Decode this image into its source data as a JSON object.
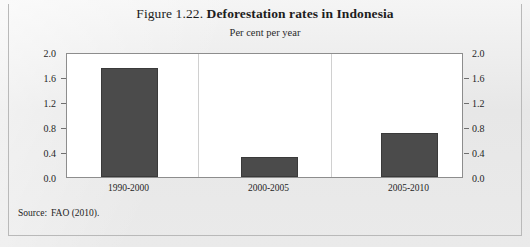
{
  "figure": {
    "label": "Figure 1.22.",
    "name": "Deforestation rates in Indonesia",
    "subtitle": "Per cent per year",
    "source_label": "Source:",
    "source_text": "FAO (2010)."
  },
  "colors": {
    "bar_fill": "#4b4b4b",
    "bar_stroke": "#3a3a3a",
    "plot_background": "#ffffff",
    "page_background": "#e8e8e8",
    "frame_border": "#b9b9b9",
    "axis_line": "#8d8d8d",
    "text": "#1f1f1f"
  },
  "chart_data": {
    "type": "bar",
    "title": "Figure 1.22. Deforestation rates in Indonesia",
    "subtitle": "Per cent per year",
    "xlabel": "",
    "ylabel": "Per cent per year",
    "categories": [
      "1990-2000",
      "2000-2005",
      "2005-2010"
    ],
    "values": [
      1.75,
      0.32,
      0.7
    ],
    "ylim": [
      0.0,
      2.0
    ],
    "yticks": [
      0.0,
      0.4,
      0.8,
      1.2,
      1.6,
      2.0
    ],
    "ytick_labels": [
      "0.0",
      "0.4",
      "0.8",
      "1.2",
      "1.6",
      "2.0"
    ],
    "dual_axis": true,
    "right_ytick_labels": [
      "0.0",
      "0.4",
      "0.8",
      "1.2",
      "1.6",
      "2.0"
    ],
    "grid": false,
    "legend": null,
    "source": "Source: FAO (2010)."
  }
}
